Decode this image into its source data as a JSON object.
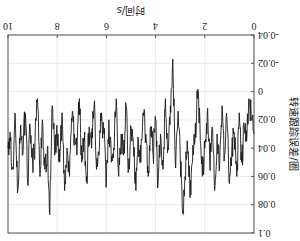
{
  "chart_data": {
    "type": "line",
    "title": "",
    "xlabel": "时间/s",
    "ylabel": "转速跟踪误差/圈",
    "xlim": [
      0,
      10
    ],
    "ylim": [
      -0.04,
      0.1
    ],
    "xticks": [
      "0",
      "2",
      "4",
      "6",
      "8",
      "10"
    ],
    "yticks": [
      "-0.04",
      "-0.02",
      "0",
      "0.02",
      "0.04",
      "0.06",
      "0.08",
      "0.1"
    ],
    "grid": true,
    "rotated_180": true,
    "line_color": "#1a1a1a",
    "series": [
      {
        "name": "tracking error",
        "x": [
          0,
          0.1,
          0.2,
          0.3,
          0.4,
          0.5,
          0.6,
          0.7,
          0.8,
          0.9,
          1.0,
          1.1,
          1.2,
          1.3,
          1.4,
          1.5,
          1.6,
          1.7,
          1.8,
          1.9,
          2.0,
          2.1,
          2.2,
          2.3,
          2.4,
          2.5,
          2.6,
          2.7,
          2.8,
          2.9,
          3.0,
          3.1,
          3.2,
          3.3,
          3.4,
          3.5,
          3.6,
          3.7,
          3.8,
          3.9,
          4.0,
          4.1,
          4.2,
          4.3,
          4.4,
          4.5,
          4.6,
          4.7,
          4.8,
          4.9,
          5.0,
          5.1,
          5.2,
          5.3,
          5.4,
          5.5,
          5.6,
          5.7,
          5.8,
          5.9,
          6.0,
          6.1,
          6.2,
          6.3,
          6.4,
          6.5,
          6.6,
          6.7,
          6.8,
          6.9,
          7.0,
          7.1,
          7.2,
          7.3,
          7.4,
          7.5,
          7.6,
          7.7,
          7.8,
          7.9,
          8.0,
          8.1,
          8.2,
          8.3,
          8.4,
          8.5,
          8.6,
          8.7,
          8.8,
          8.9,
          9.0,
          9.1,
          9.2,
          9.3,
          9.4,
          9.5,
          9.6,
          9.7,
          9.8,
          9.9,
          10.0
        ],
        "values": [
          0.03,
          0.02,
          0.005,
          0.035,
          0.025,
          0.05,
          0.015,
          0.06,
          0.03,
          0.04,
          0.065,
          0.02,
          0.045,
          0.01,
          0.055,
          0.03,
          0.07,
          0.025,
          0.05,
          0.015,
          0.04,
          0.06,
          0.02,
          0.005,
          0.035,
          0.05,
          0.075,
          0.04,
          0.06,
          0.086,
          0.045,
          0.02,
          0.05,
          -0.023,
          0.01,
          0.04,
          0.005,
          0.055,
          0.03,
          0.065,
          0.02,
          0.045,
          0.025,
          0.06,
          0.03,
          0.015,
          0.05,
          0.035,
          0.07,
          0.04,
          0.025,
          0.055,
          0.01,
          0.045,
          0.03,
          0.06,
          0.005,
          0.04,
          0.05,
          0.02,
          0.065,
          0.03,
          0.015,
          0.045,
          0.055,
          0.01,
          0.04,
          0.025,
          0.06,
          0.035,
          0.05,
          0.005,
          0.045,
          0.03,
          0.02,
          0.06,
          0.04,
          0.07,
          0.015,
          0.05,
          0.03,
          0.045,
          0.01,
          0.087,
          0.04,
          0.055,
          0.02,
          0.06,
          0.005,
          0.035,
          0.05,
          0.025,
          0.065,
          0.015,
          0.045,
          0.03,
          0.07,
          0.02,
          0.055,
          0.035,
          0.04
        ]
      }
    ]
  }
}
